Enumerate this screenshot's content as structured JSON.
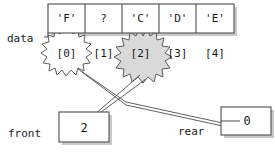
{
  "diagram": {
    "array_label": "data",
    "cells": [
      {
        "index": "[0]",
        "value": "'F'",
        "highlighted": true
      },
      {
        "index": "[1]",
        "value": "?",
        "highlighted": false
      },
      {
        "index": "[2]",
        "value": "'C'",
        "highlighted": true
      },
      {
        "index": "[3]",
        "value": "'D'",
        "highlighted": false
      },
      {
        "index": "[4]",
        "value": "'E'",
        "highlighted": false
      }
    ],
    "pointers": [
      {
        "name": "front",
        "label": "front",
        "value": "2"
      },
      {
        "name": "rear",
        "label": "rear",
        "value": "0"
      }
    ],
    "colors": {
      "stroke": "#4d4d4d",
      "text": "#1a1a1a",
      "highlight_fill": "#d9d9d9",
      "shadow": "#c9c9c9",
      "background": "#ffffff"
    }
  }
}
